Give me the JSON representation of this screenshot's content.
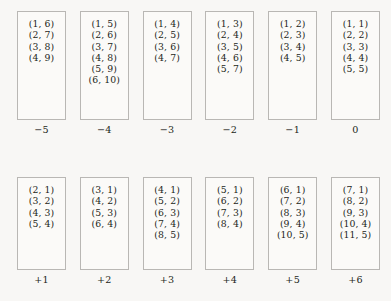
{
  "figure": {
    "title": "",
    "geometry": {
      "box_width": 49,
      "box_pitch": 62.8,
      "first_box_left": 17,
      "top_row_top": 11,
      "bottom_row_top": 177,
      "top_box_height": 109,
      "bottom_box_height": 93
    },
    "colors": {
      "background": "#f8f7f5",
      "box_fill": "#fbfaf8",
      "box_border": "#b9b7b4",
      "text": "#231f20"
    },
    "rows": [
      {
        "name": "top-row",
        "cells": [
          {
            "label": "−5",
            "pairs": [
              "(1, 6)",
              "(2, 7)",
              "(3, 8)",
              "(4, 9)"
            ]
          },
          {
            "label": "−4",
            "pairs": [
              "(1, 5)",
              "(2, 6)",
              "(3, 7)",
              "(4, 8)",
              "(5, 9)",
              "(6, 10)"
            ]
          },
          {
            "label": "−3",
            "pairs": [
              "(1, 4)",
              "(2, 5)",
              "(3, 6)",
              "(4, 7)"
            ]
          },
          {
            "label": "−2",
            "pairs": [
              "(1, 3)",
              "(2, 4)",
              "(3, 5)",
              "(4, 6)",
              "(5, 7)"
            ]
          },
          {
            "label": "−1",
            "pairs": [
              "(1, 2)",
              "(2, 3)",
              "(3, 4)",
              "(4, 5)"
            ]
          },
          {
            "label": "0",
            "pairs": [
              "(1, 1)",
              "(2, 2)",
              "(3, 3)",
              "(4, 4)",
              "(5, 5)"
            ]
          }
        ]
      },
      {
        "name": "bottom-row",
        "cells": [
          {
            "label": "+1",
            "pairs": [
              "(2, 1)",
              "(3, 2)",
              "(4, 3)",
              "(5, 4)"
            ]
          },
          {
            "label": "+2",
            "pairs": [
              "(3, 1)",
              "(4, 2)",
              "(5, 3)",
              "(6, 4)"
            ]
          },
          {
            "label": "+3",
            "pairs": [
              "(4, 1)",
              "(5, 2)",
              "(6, 3)",
              "(7, 4)",
              "(8, 5)"
            ]
          },
          {
            "label": "+4",
            "pairs": [
              "(5, 1)",
              "(6, 2)",
              "(7, 3)",
              "(8, 4)"
            ]
          },
          {
            "label": "+5",
            "pairs": [
              "(6, 1)",
              "(7, 2)",
              "(8, 3)",
              "(9, 4)",
              "(10, 5)"
            ]
          },
          {
            "label": "+6",
            "pairs": [
              "(7, 1)",
              "(8, 2)",
              "(9, 3)",
              "(10, 4)",
              "(11, 5)"
            ]
          }
        ]
      }
    ]
  }
}
